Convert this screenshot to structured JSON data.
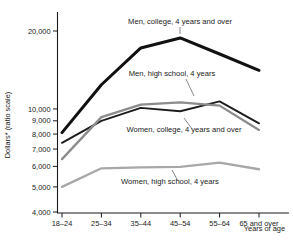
{
  "chart_data": {
    "type": "line",
    "title": "",
    "xlabel": "Years of age",
    "ylabel": "Dollars* (ratio scale)",
    "yscale": "log",
    "ylim": [
      4000,
      22000
    ],
    "grid": false,
    "legend_position": "inline-annotations",
    "categories": [
      "18–24",
      "25–34",
      "35–44",
      "45–54",
      "55–64",
      "65 and over"
    ],
    "ytick_labels": [
      "20,000",
      "10,000",
      "9,000",
      "8,000",
      "7,000",
      "6,000",
      "5,000",
      "4,000"
    ],
    "ytick_values": [
      20000,
      10000,
      9000,
      8000,
      7000,
      6000,
      5000,
      4000
    ],
    "series": [
      {
        "name": "Men, college, 4 years and over",
        "color": "#111111",
        "width": 3.0,
        "values": [
          8100,
          12400,
          17200,
          18800,
          16300,
          14100
        ]
      },
      {
        "name": "Men, high school, 4 years",
        "color": "#1d1d1d",
        "width": 1.9,
        "values": [
          7400,
          9000,
          10100,
          9800,
          10700,
          8800
        ]
      },
      {
        "name": "Women, college, 4 years and over",
        "color": "#8c8c8c",
        "width": 2.3,
        "values": [
          6400,
          9300,
          10400,
          10600,
          10300,
          8300
        ]
      },
      {
        "name": "Women, high school, 4 years",
        "color": "#a8a8a8",
        "width": 2.3,
        "values": [
          5000,
          5900,
          5950,
          5980,
          6200,
          5850
        ]
      }
    ],
    "annotations": [
      {
        "text": "Men, college, 4 years and over",
        "text_x": 180,
        "text_y": 24,
        "anchor": "middle",
        "leader": [
          [
            180,
            27
          ],
          [
            180,
            34
          ]
        ]
      },
      {
        "text": "Men, high school, 4 years",
        "text_x": 172,
        "text_y": 76,
        "anchor": "middle",
        "leader": [
          [
            186,
            79
          ],
          [
            194,
            96
          ]
        ]
      },
      {
        "text": "Women, college, 4 years and over",
        "text_x": 184,
        "text_y": 132,
        "anchor": "middle",
        "leader": [
          [
            192,
            129
          ],
          [
            184,
            118
          ]
        ]
      },
      {
        "text": "Women, high school, 4 years",
        "text_x": 170,
        "text_y": 184,
        "anchor": "middle",
        "leader": [
          [
            178,
            181
          ],
          [
            172,
            170
          ]
        ]
      }
    ]
  }
}
